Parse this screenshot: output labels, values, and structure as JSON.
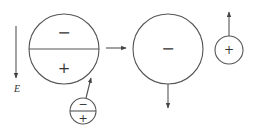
{
  "diagram": {
    "field_label": "E",
    "big_dipole": {
      "top_sign": "−",
      "bottom_sign": "+"
    },
    "small_dipole": {
      "top_sign": "−",
      "bottom_sign": "+"
    },
    "negative_sphere": {
      "sign": "−"
    },
    "positive_sphere": {
      "sign": "+"
    },
    "colors": {
      "stroke": "#555555",
      "text": "#333333",
      "background": "#ffffff"
    }
  }
}
